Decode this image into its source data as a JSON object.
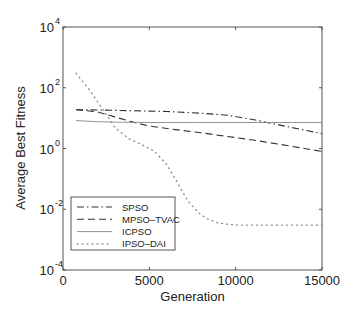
{
  "chart_data": {
    "type": "line",
    "title": "",
    "xlabel": "Generation",
    "ylabel": "Average Best Fitness",
    "xlim": [
      0,
      15000
    ],
    "ylim": [
      0.0001,
      10000
    ],
    "yscale": "log",
    "grid": false,
    "legend_position": "lower left",
    "x_ticks": [
      0,
      5000,
      10000,
      15000
    ],
    "x_tick_labels": [
      "0",
      "5000",
      "10000",
      "15000"
    ],
    "y_ticks": [
      -4,
      -2,
      0,
      2,
      4
    ],
    "y_tick_labels": [
      "10",
      "10",
      "10",
      "10",
      "10"
    ],
    "y_tick_exponents": [
      "-4",
      "-2",
      "0",
      "2",
      "4"
    ],
    "series": [
      {
        "name": "SPSO",
        "style": "dashdot",
        "x": [
          750,
          2000,
          4000,
          6000,
          8000,
          9500,
          11000,
          12500,
          14000,
          15000
        ],
        "values": [
          19,
          18.5,
          17.5,
          16.5,
          14.5,
          12.5,
          9,
          6,
          4,
          3.1
        ]
      },
      {
        "name": "MPSO-TVAC",
        "style": "dashed",
        "x": [
          750,
          2000,
          3000,
          4000,
          5000,
          6500,
          8000,
          9500,
          11000,
          12500,
          14000,
          15000
        ],
        "values": [
          19,
          16,
          11,
          7.5,
          5.5,
          4.2,
          3.3,
          2.5,
          1.9,
          1.4,
          1.0,
          0.8
        ]
      },
      {
        "name": "ICPSO",
        "style": "solid",
        "x": [
          750,
          2000,
          3500,
          5000,
          7500,
          10000,
          12500,
          15000
        ],
        "values": [
          8.3,
          7.6,
          7.3,
          7.2,
          7.2,
          7.2,
          7.2,
          7.2
        ]
      },
      {
        "name": "IPSO-DAI",
        "style": "dotted",
        "x": [
          750,
          1500,
          2300,
          3000,
          3800,
          4500,
          5300,
          6000,
          6600,
          7200,
          7800,
          8300,
          9000,
          10000,
          11000,
          12500,
          14000,
          15000
        ],
        "values": [
          300,
          90,
          20,
          5,
          2.1,
          1.4,
          0.8,
          0.3,
          0.08,
          0.02,
          0.008,
          0.005,
          0.0035,
          0.003,
          0.003,
          0.003,
          0.003,
          0.003
        ]
      }
    ]
  },
  "legend": {
    "items": [
      {
        "label": "SPSO",
        "style": "dashdot"
      },
      {
        "label": "MPSO–TVAC",
        "style": "dashed"
      },
      {
        "label": "ICPSO",
        "style": "solid"
      },
      {
        "label": "IPSO–DAI",
        "style": "dotted"
      }
    ]
  },
  "colors": {
    "axis": "#444444",
    "spso": "#333333",
    "mpso": "#333333",
    "icpso": "#888888",
    "ipso": "#888888"
  }
}
